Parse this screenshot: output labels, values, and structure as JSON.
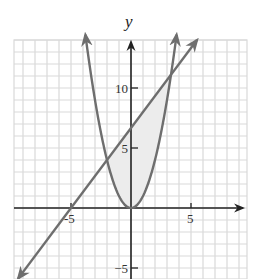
{
  "chart_data": {
    "type": "line",
    "title": "",
    "xlabel": "x",
    "ylabel": "y",
    "xlim": [
      -9.75,
      9.7
    ],
    "ylim": [
      -5.9,
      14
    ],
    "grid": true,
    "x_ticks": [
      -5,
      5
    ],
    "x_tick_labels": [
      "-5",
      "5"
    ],
    "y_ticks": [
      10,
      5,
      -5
    ],
    "y_tick_labels": [
      "10",
      "5",
      "−5"
    ],
    "series": [
      {
        "name": "parabola",
        "equation": "y = x^2",
        "color": "#6e6e6e",
        "arrows": "both",
        "x_range": [
          -3.8,
          3.8
        ]
      },
      {
        "name": "line",
        "equation": "y = (4/3)x + 20/3",
        "color": "#6e6e6e",
        "arrows": "both",
        "x_range": [
          -9.4,
          5.5
        ]
      }
    ],
    "shaded_region": {
      "between": [
        "line",
        "parabola"
      ],
      "x_from": -2,
      "x_to": 3.3333,
      "color": "#ededed"
    },
    "intersections": [
      [
        -2,
        4
      ],
      [
        3.3333,
        11.111
      ]
    ]
  },
  "style": {
    "grid_color": "#d9d9d9",
    "axis_color": "#222222",
    "curve_color": "#6e6e6e",
    "shade_color": "#ececec"
  },
  "layout": {
    "origin_px": [
      131,
      208
    ],
    "unit_px": 12,
    "plot_left": 14,
    "plot_right": 247,
    "plot_top": 40,
    "plot_bottom": 279
  }
}
